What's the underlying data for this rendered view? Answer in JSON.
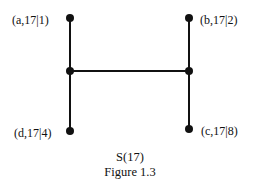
{
  "diagram": {
    "title": "S(17)",
    "caption": "Figure 1.3",
    "nodes": [
      {
        "id": "a",
        "label": "(a,17|1)"
      },
      {
        "id": "b",
        "label": "(b,17|2)"
      },
      {
        "id": "d",
        "label": "(d,17|4)"
      },
      {
        "id": "c",
        "label": "(c,17|8)"
      },
      {
        "id": "left-junction",
        "label": ""
      },
      {
        "id": "right-junction",
        "label": ""
      }
    ],
    "edges": [
      [
        "a",
        "left-junction"
      ],
      [
        "left-junction",
        "d"
      ],
      [
        "b",
        "right-junction"
      ],
      [
        "right-junction",
        "c"
      ],
      [
        "left-junction",
        "right-junction"
      ]
    ],
    "colors": {
      "ink": "#111111",
      "background": "#ffffff"
    }
  }
}
